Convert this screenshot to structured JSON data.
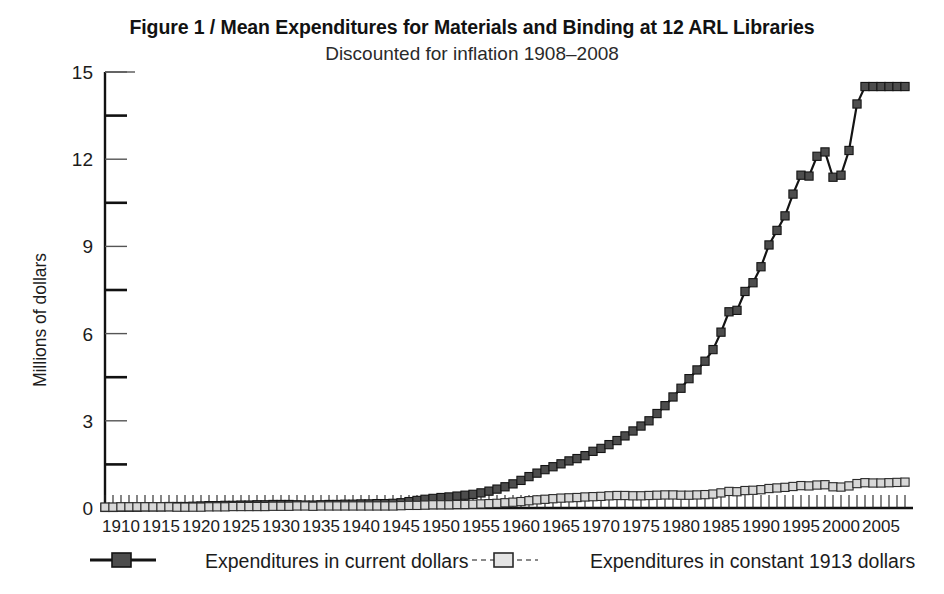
{
  "figure": {
    "title": "Figure 1  /  Mean Expenditures for Materials and Binding at 12 ARL Libraries",
    "subtitle": "Discounted for inflation 1908–2008"
  },
  "chart_data": {
    "type": "line",
    "title": "Figure 1  /  Mean Expenditures for Materials and Binding at 12 ARL Libraries",
    "subtitle": "Discounted for inflation 1908–2008",
    "xlabel": "",
    "ylabel": "Millions of dollars",
    "xlim": [
      1908,
      2008
    ],
    "ylim": [
      0,
      15
    ],
    "yticks": [
      0,
      3,
      6,
      9,
      12,
      15
    ],
    "ytick_labels": [
      "0",
      "3",
      "6",
      "9",
      "12",
      "15"
    ],
    "yminor_ticks": [
      1.5,
      4.5,
      7.5,
      10.5,
      13.5
    ],
    "xticks": [
      1910,
      1915,
      1920,
      1925,
      1930,
      1935,
      1940,
      1945,
      1950,
      1955,
      1960,
      1965,
      1970,
      1975,
      1980,
      1985,
      1990,
      1995,
      2000,
      2005
    ],
    "xtick_labels": [
      "1910",
      "1915",
      "1920",
      "1925",
      "1930",
      "1935",
      "1940",
      "1945",
      "1950",
      "1955",
      "1960",
      "1965",
      "1970",
      "1975",
      "1980",
      "1985",
      "1990",
      "1995",
      "2000",
      "2005"
    ],
    "xminor_step": 1,
    "grid": false,
    "legend_position": "below",
    "marker": "square",
    "x": [
      1908,
      1909,
      1910,
      1911,
      1912,
      1913,
      1914,
      1915,
      1916,
      1917,
      1918,
      1919,
      1920,
      1921,
      1922,
      1923,
      1924,
      1925,
      1926,
      1927,
      1928,
      1929,
      1930,
      1931,
      1932,
      1933,
      1934,
      1935,
      1936,
      1937,
      1938,
      1939,
      1940,
      1941,
      1942,
      1943,
      1944,
      1945,
      1946,
      1947,
      1948,
      1949,
      1950,
      1951,
      1952,
      1953,
      1954,
      1955,
      1956,
      1957,
      1958,
      1959,
      1960,
      1961,
      1962,
      1963,
      1964,
      1965,
      1966,
      1967,
      1968,
      1969,
      1970,
      1971,
      1972,
      1973,
      1974,
      1975,
      1976,
      1977,
      1978,
      1979,
      1980,
      1981,
      1982,
      1983,
      1984,
      1985,
      1986,
      1987,
      1988,
      1989,
      1990,
      1991,
      1992,
      1993,
      1994,
      1995,
      1996,
      1997,
      1998,
      1999,
      2000,
      2001,
      2002,
      2003,
      2004,
      2005,
      2006,
      2007,
      2008
    ],
    "series": [
      {
        "name": "Expenditures in current dollars",
        "color": "#4d4d4d",
        "edge_color": "#141414",
        "line_style": "solid",
        "marker": "filled-square",
        "values": [
          0.02,
          0.02,
          0.03,
          0.03,
          0.03,
          0.04,
          0.04,
          0.04,
          0.05,
          0.05,
          0.05,
          0.06,
          0.07,
          0.08,
          0.08,
          0.09,
          0.09,
          0.1,
          0.1,
          0.11,
          0.11,
          0.12,
          0.12,
          0.12,
          0.11,
          0.1,
          0.1,
          0.11,
          0.12,
          0.12,
          0.13,
          0.13,
          0.14,
          0.14,
          0.15,
          0.15,
          0.16,
          0.18,
          0.22,
          0.26,
          0.3,
          0.33,
          0.36,
          0.38,
          0.41,
          0.44,
          0.47,
          0.52,
          0.58,
          0.65,
          0.73,
          0.83,
          0.95,
          1.08,
          1.2,
          1.32,
          1.42,
          1.52,
          1.62,
          1.7,
          1.8,
          1.95,
          2.05,
          2.18,
          2.32,
          2.48,
          2.65,
          2.82,
          3.0,
          3.25,
          3.52,
          3.82,
          4.12,
          4.45,
          4.75,
          5.05,
          5.45,
          6.05,
          6.75,
          6.8,
          7.45,
          7.75,
          8.3,
          9.05,
          9.55,
          10.05,
          10.8,
          11.45,
          11.42,
          12.1,
          12.25,
          11.38,
          11.45,
          12.3,
          13.9,
          14.5,
          14.5,
          14.5,
          14.5,
          14.5,
          14.5
        ]
      },
      {
        "name": "Expenditures in constant 1913 dollars",
        "color": "#d8d8d8",
        "edge_color": "#2a2a2a",
        "line_style": "dashed",
        "marker": "open-square",
        "values": [
          0.03,
          0.03,
          0.04,
          0.04,
          0.04,
          0.04,
          0.04,
          0.04,
          0.04,
          0.03,
          0.03,
          0.03,
          0.03,
          0.04,
          0.04,
          0.04,
          0.05,
          0.05,
          0.05,
          0.05,
          0.05,
          0.06,
          0.06,
          0.06,
          0.07,
          0.07,
          0.06,
          0.07,
          0.07,
          0.07,
          0.07,
          0.07,
          0.07,
          0.07,
          0.07,
          0.07,
          0.07,
          0.08,
          0.09,
          0.09,
          0.1,
          0.11,
          0.11,
          0.11,
          0.12,
          0.12,
          0.13,
          0.14,
          0.15,
          0.16,
          0.18,
          0.2,
          0.22,
          0.25,
          0.28,
          0.3,
          0.32,
          0.34,
          0.35,
          0.36,
          0.38,
          0.39,
          0.4,
          0.42,
          0.43,
          0.43,
          0.42,
          0.42,
          0.43,
          0.44,
          0.45,
          0.45,
          0.44,
          0.44,
          0.45,
          0.46,
          0.48,
          0.52,
          0.57,
          0.56,
          0.6,
          0.61,
          0.63,
          0.67,
          0.69,
          0.71,
          0.74,
          0.77,
          0.76,
          0.79,
          0.8,
          0.73,
          0.72,
          0.76,
          0.84,
          0.87,
          0.86,
          0.86,
          0.87,
          0.88,
          0.89
        ]
      }
    ]
  },
  "legend": {
    "items": [
      {
        "label": "Expenditures in current dollars",
        "style": "solid-filled"
      },
      {
        "label": "Expenditures in constant 1913 dollars",
        "style": "dashed-open"
      }
    ]
  }
}
